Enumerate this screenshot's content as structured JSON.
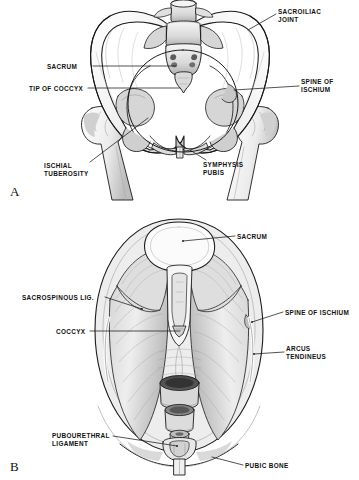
{
  "figure": {
    "background_color": "#ffffff",
    "ink_color": "#1a1a1a",
    "shade_light": "#e8e8e8",
    "shade_mid": "#c9c9c9",
    "shade_dark": "#8e8e8e",
    "shade_darkest": "#4a4a4a"
  },
  "panels": [
    {
      "letter": "A",
      "name": "anterior-pelvis-bone-view",
      "description": "Anterior view of bony pelvis with sacrum, coccyx, ischium and femoral heads",
      "labels": [
        {
          "id": "sacroiliac-joint",
          "text": "SACROILIAC\nJOINT",
          "x": 278,
          "y": 8,
          "align": "left"
        },
        {
          "id": "sacrum",
          "text": "SACRUM",
          "x": 47,
          "y": 63,
          "align": "left"
        },
        {
          "id": "tip-of-coccyx",
          "text": "TIP OF COCCYX",
          "x": 29,
          "y": 85,
          "align": "left"
        },
        {
          "id": "spine-of-ischium",
          "text": "SPINE OF\nISCHIUM",
          "x": 301,
          "y": 78,
          "align": "left"
        },
        {
          "id": "ischial-tuberosity",
          "text": "ISCHIAL\nTUBEROSITY",
          "x": 44,
          "y": 162,
          "align": "left"
        },
        {
          "id": "symphysis-pubis",
          "text": "SYMPHYSIS\nPUBIS",
          "x": 203,
          "y": 161,
          "align": "left"
        }
      ]
    },
    {
      "letter": "B",
      "name": "superior-pelvic-floor-view",
      "description": "Superior view of pelvic floor musculature with sacrum, coccyx, arcus tendineus, and pelvic openings",
      "labels": [
        {
          "id": "sacrum-b",
          "text": "SACRUM",
          "x": 237,
          "y": 233,
          "align": "left"
        },
        {
          "id": "sacrospinous-lig",
          "text": "SACROSPINOUS LIG.",
          "x": 22,
          "y": 294,
          "align": "left"
        },
        {
          "id": "coccyx",
          "text": "COCCYX",
          "x": 56,
          "y": 328,
          "align": "left"
        },
        {
          "id": "spine-of-ischium-b",
          "text": "SPINE OF ISCHIUM",
          "x": 285,
          "y": 309,
          "align": "left"
        },
        {
          "id": "arcus-tendineus",
          "text": "ARCUS\nTENDINEUS",
          "x": 286,
          "y": 345,
          "align": "left"
        },
        {
          "id": "pubourethral-ligament",
          "text": "PUBOURETHRAL\nLIGAMENT",
          "x": 52,
          "y": 432,
          "align": "left"
        },
        {
          "id": "pubic-bone",
          "text": "PUBIC BONE",
          "x": 245,
          "y": 462,
          "align": "left"
        }
      ]
    }
  ]
}
